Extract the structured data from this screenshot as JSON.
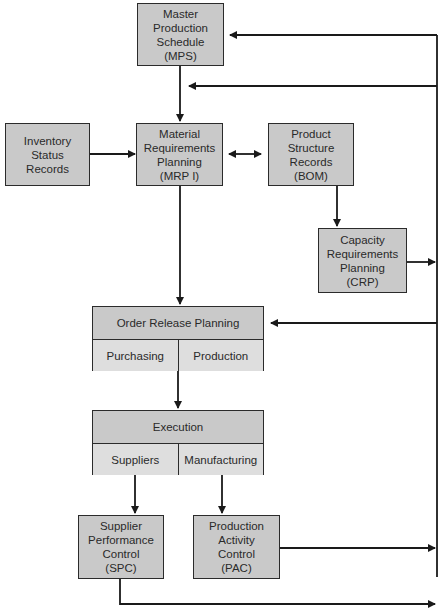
{
  "diagram": {
    "colors": {
      "box_fill": "#c9c9c9",
      "sub_fill": "#dedede",
      "line": "#1a1a1a"
    },
    "nodes": {
      "mps": {
        "lines": [
          "Master",
          "Production",
          "Schedule",
          "(MPS)"
        ]
      },
      "inventory": {
        "lines": [
          "Inventory",
          "Status",
          "Records"
        ]
      },
      "mrp": {
        "lines": [
          "Material",
          "Requirements",
          "Planning",
          "(MRP I)"
        ]
      },
      "bom": {
        "lines": [
          "Product",
          "Structure",
          "Records",
          "(BOM)"
        ]
      },
      "crp": {
        "lines": [
          "Capacity",
          "Requirements",
          "Planning",
          "(CRP)"
        ]
      },
      "order_release": {
        "title": "Order Release Planning",
        "cells": [
          "Purchasing",
          "Production"
        ]
      },
      "execution": {
        "title": "Execution",
        "cells": [
          "Suppliers",
          "Manufacturing"
        ]
      },
      "spc": {
        "lines": [
          "Supplier",
          "Performance",
          "Control",
          "(SPC)"
        ]
      },
      "pac": {
        "lines": [
          "Production",
          "Activity",
          "Control",
          "(PAC)"
        ]
      }
    },
    "edges": [
      {
        "from": "mps",
        "to": "mrp"
      },
      {
        "from": "inventory",
        "to": "mrp"
      },
      {
        "from": "mrp",
        "to": "bom",
        "bidirectional": true
      },
      {
        "from": "bom",
        "to": "crp"
      },
      {
        "from": "mrp",
        "to": "order_release"
      },
      {
        "from": "order_release",
        "to": "execution"
      },
      {
        "from": "execution.suppliers",
        "to": "spc"
      },
      {
        "from": "execution.manufacturing",
        "to": "pac"
      },
      {
        "from": "crp",
        "to": "feedback_loop"
      },
      {
        "from": "pac",
        "to": "feedback_loop"
      },
      {
        "from": "spc",
        "to": "feedback_loop"
      },
      {
        "from": "feedback_loop",
        "to": "mps"
      },
      {
        "from": "feedback_loop",
        "to": "mps_mrp_link"
      },
      {
        "from": "feedback_loop",
        "to": "order_release"
      }
    ]
  }
}
